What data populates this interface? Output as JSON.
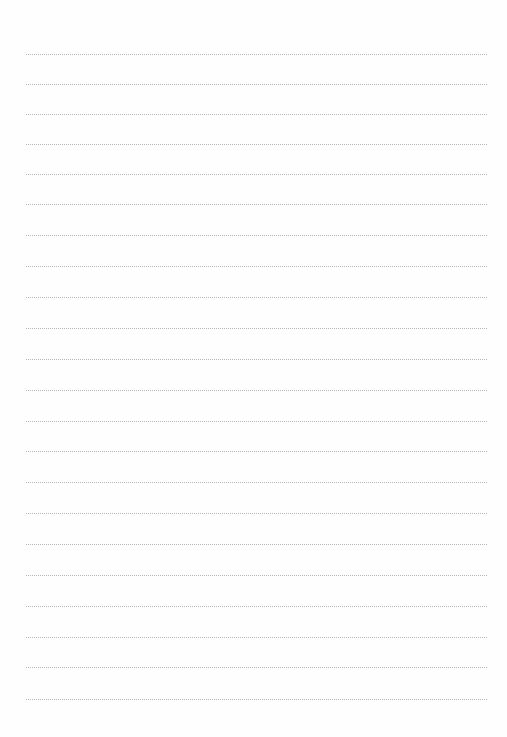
{
  "page": {
    "type": "lined-paper",
    "background_color": "#fefefe",
    "rule_color": "#b8b8b8",
    "rule_style": "dotted",
    "rule_left": 26,
    "rule_right": 487,
    "rules_y": [
      54,
      84,
      114,
      144,
      174,
      204,
      235,
      266,
      297,
      328,
      359,
      390,
      421,
      451,
      482,
      513,
      544,
      575,
      606,
      637,
      667,
      699
    ],
    "text": []
  }
}
